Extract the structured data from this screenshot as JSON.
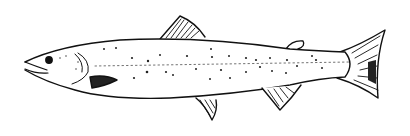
{
  "image": {
    "subject": "salmon line drawing",
    "background_color": "#ffffff",
    "ink_color": "#111111"
  }
}
